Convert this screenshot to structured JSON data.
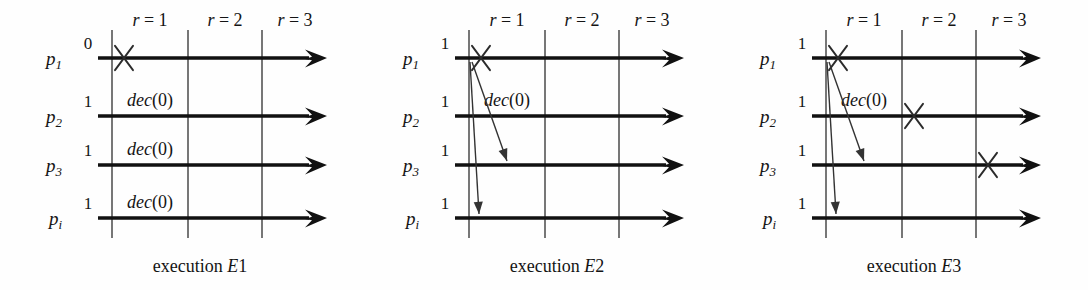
{
  "figure": {
    "type": "distributed-algorithm-execution-diagram",
    "panel_count": 3,
    "process_labels": [
      "p",
      "p",
      "p",
      "p"
    ],
    "process_subscripts": [
      "1",
      "2",
      "3",
      "i"
    ],
    "round_labels": [
      "r = 1",
      "r = 2",
      "r = 3"
    ],
    "decision_label": "dec(0)",
    "colors": {
      "process_line": "#111111",
      "round_line": "#4a4a4a",
      "crash_mark": "#2b2b2b",
      "message_arrow": "#333333",
      "text": "#141414",
      "background": "#ffffff"
    }
  },
  "panels": [
    {
      "id": "E1",
      "caption_prefix": "execution",
      "caption_name": "E1",
      "caption_italic_part": "E",
      "caption_number_part": "1",
      "initial_values": [
        "0",
        "1",
        "1",
        "1"
      ],
      "processes": [
        {
          "name": "p",
          "sub": "1",
          "initial": "0",
          "decision": null,
          "crash": {
            "round": 1,
            "position": "start-of-round-1"
          }
        },
        {
          "name": "p",
          "sub": "2",
          "initial": "1",
          "decision": "dec(0)",
          "crash": null
        },
        {
          "name": "p",
          "sub": "3",
          "initial": "1",
          "decision": "dec(0)",
          "crash": null
        },
        {
          "name": "p",
          "sub": "i",
          "initial": "1",
          "decision": "dec(0)",
          "crash": null
        }
      ],
      "messages": [],
      "crash_count": 1,
      "decisions": [
        "dec(0)",
        "dec(0)",
        "dec(0)"
      ]
    },
    {
      "id": "E2",
      "caption_prefix": "execution",
      "caption_name": "E2",
      "caption_italic_part": "E",
      "caption_number_part": "2",
      "initial_values": [
        "1",
        "1",
        "1",
        "1"
      ],
      "processes": [
        {
          "name": "p",
          "sub": "1",
          "initial": "1",
          "decision": null,
          "crash": {
            "round": 1,
            "position": "start-of-round-1"
          }
        },
        {
          "name": "p",
          "sub": "2",
          "initial": "1",
          "decision": "dec(0)",
          "crash": null
        },
        {
          "name": "p",
          "sub": "3",
          "initial": "1",
          "decision": null,
          "crash": null
        },
        {
          "name": "p",
          "sub": "i",
          "initial": "1",
          "decision": null,
          "crash": null
        }
      ],
      "messages": [
        {
          "from": "p1",
          "to": "p3",
          "round": 1
        },
        {
          "from": "p1",
          "to": "pi",
          "round": 1
        }
      ],
      "crash_count": 1,
      "decisions": [
        "dec(0)"
      ]
    },
    {
      "id": "E3",
      "caption_prefix": "execution",
      "caption_name": "E3",
      "caption_italic_part": "E",
      "caption_number_part": "3",
      "initial_values": [
        "1",
        "1",
        "1",
        "1"
      ],
      "processes": [
        {
          "name": "p",
          "sub": "1",
          "initial": "1",
          "decision": null,
          "crash": {
            "round": 1,
            "position": "start-of-round-1"
          }
        },
        {
          "name": "p",
          "sub": "2",
          "initial": "1",
          "decision": "dec(0)",
          "crash": {
            "round": 2,
            "position": "start-of-round-2"
          }
        },
        {
          "name": "p",
          "sub": "3",
          "initial": "1",
          "decision": null,
          "crash": {
            "round": 3,
            "position": "start-of-round-3"
          }
        },
        {
          "name": "p",
          "sub": "i",
          "initial": "1",
          "decision": null,
          "crash": null
        }
      ],
      "messages": [
        {
          "from": "p1",
          "to": "p3",
          "round": 1
        },
        {
          "from": "p1",
          "to": "pi",
          "round": 1
        }
      ],
      "crash_count": 3,
      "decisions": [
        "dec(0)"
      ]
    }
  ]
}
